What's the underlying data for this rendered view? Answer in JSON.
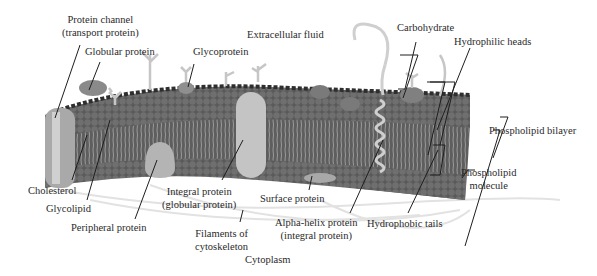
{
  "diagram": {
    "type": "cell-membrane-illustration",
    "colors": {
      "background": "#ffffff",
      "head_dark": "#4a4a4a",
      "head_mid": "#6e6e6e",
      "tail": "#8a8a8a",
      "protein_light": "#bdbdbd",
      "protein_mid": "#9a9a9a",
      "carbohydrate": "#c8c8c8",
      "leader_line": "#1e1e1e",
      "filament": "#dedede"
    },
    "labels": {
      "protein_channel_1": "Protein channel",
      "protein_channel_2": "(transport protein)",
      "globular_protein": "Globular protein",
      "glycoprotein": "Glycoprotein",
      "extracellular_fluid": "Extracellular fluid",
      "carbohydrate": "Carbohydrate",
      "hydrophilic_heads": "Hydrophilic heads",
      "phospholipid_bilayer": "Phospholipid bilayer",
      "phospholipid_molecule_1": "Phospholipid",
      "phospholipid_molecule_2": "molecule",
      "cholesterol": "Cholesterol",
      "glycolipid": "Glycolipid",
      "peripheral_protein": "Peripheral protein",
      "integral_protein_1": "Integral protein",
      "integral_protein_2": "(globular protein)",
      "filaments_1": "Filaments of",
      "filaments_2": "cytoskeleton",
      "cytoplasm": "Cytoplasm",
      "surface_protein": "Surface protein",
      "alpha_helix_1": "Alpha-helix protein",
      "alpha_helix_2": "(integral protein)",
      "hydrophobic_tails": "Hydrophobic tails"
    }
  }
}
